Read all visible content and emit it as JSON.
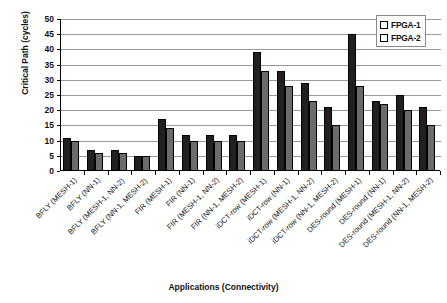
{
  "chart_data": {
    "type": "bar",
    "title": "",
    "xlabel": "Applications (Connectivity)",
    "ylabel": "Critical Path (cycles)",
    "ylim": [
      0,
      50
    ],
    "ytick_step": 5,
    "yticks": [
      "50",
      "45",
      "40",
      "35",
      "30",
      "25",
      "20",
      "15",
      "10",
      "5",
      "0"
    ],
    "grid": true,
    "legend_position": "top-right",
    "categories": [
      "BFLY (MESH-1)",
      "BFLY (NN-1)",
      "BFLY (MESH-1, NN-2)",
      "BFLY (NN-1, MESH-2)",
      "FIR (MESH-1)",
      "FIR (NN-1)",
      "FIR (MESH-1, NN-2)",
      "FIR (NN-1, MESH-2)",
      "iDCT-row (MESH-1)",
      "iDCT-row (NN-1)",
      "iDCT-row (MESH-1, NN-2)",
      "iDCT-row (NN-1, MESH-2)",
      "DES-round (MESH-1)",
      "DES-round (NN-1)",
      "DES-round (MESH-1, NN-2)",
      "DES-round (NN-1, MESH-2)"
    ],
    "series": [
      {
        "name": "FPGA-1",
        "color": "#231f20",
        "values": [
          11,
          7,
          7,
          5,
          17,
          12,
          12,
          12,
          39,
          33,
          29,
          21,
          45,
          23,
          25,
          21
        ]
      },
      {
        "name": "FPGA-2",
        "color": "#6d6a6b",
        "values": [
          10,
          6,
          6,
          5,
          14,
          10,
          10,
          10,
          33,
          28,
          23,
          15,
          28,
          22,
          20,
          15
        ]
      }
    ]
  },
  "legend": {
    "items": [
      {
        "label": "FPGA-1",
        "color": "#231f20"
      },
      {
        "label": "FPGA-2",
        "color": "#6d6a6b"
      }
    ]
  }
}
